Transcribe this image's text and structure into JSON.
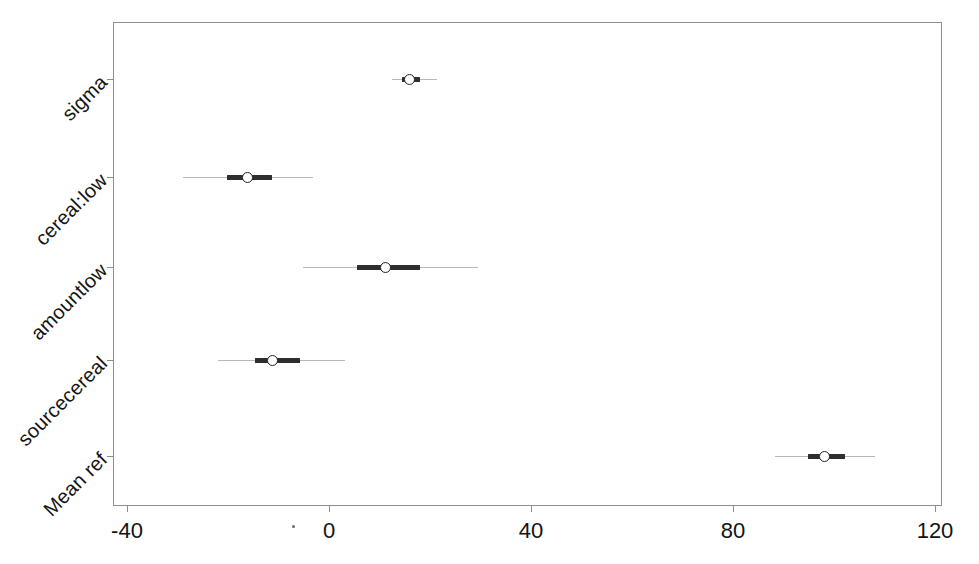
{
  "chart_data": {
    "type": "scatter",
    "title": "",
    "subtitle": "",
    "xlabel": "",
    "ylabel": "",
    "xlim": [
      -40,
      120
    ],
    "xticks": [
      -40,
      0,
      40,
      80,
      120
    ],
    "xticklabels": [
      "-40",
      "0",
      "40",
      "80",
      "120"
    ],
    "grid": false,
    "legend": null,
    "orientation": "horizontal",
    "categories": [
      "sigma",
      "cereal:low",
      "amountlow",
      "sourcecereal",
      "Mean ref"
    ],
    "series": [
      {
        "name": "point estimate",
        "values": [
          16.0,
          -16.2,
          11.1,
          -11.1,
          98.2
        ]
      },
      {
        "name": "inner interval (thick)",
        "lower": [
          14.5,
          -20.2,
          5.5,
          -14.7,
          94.9
        ],
        "upper": [
          18.0,
          -11.3,
          18.0,
          -5.7,
          102.2
        ]
      },
      {
        "name": "outer interval (thin)",
        "lower": [
          12.5,
          -28.9,
          -5.1,
          -22.0,
          88.3
        ],
        "upper": [
          21.4,
          -3.2,
          29.5,
          3.2,
          108.1
        ]
      }
    ],
    "rows": [
      {
        "label": "sigma",
        "estimate": 16.0,
        "inner_low": 14.5,
        "inner_high": 18.0,
        "outer_low": 12.5,
        "outer_high": 21.4
      },
      {
        "label": "cereal:low",
        "estimate": -16.2,
        "inner_low": -20.2,
        "inner_high": -11.3,
        "outer_low": -28.9,
        "outer_high": -3.2
      },
      {
        "label": "amountlow",
        "estimate": 11.1,
        "inner_low": 5.5,
        "inner_high": 18.0,
        "outer_low": -5.1,
        "outer_high": 29.5
      },
      {
        "label": "sourcecereal",
        "estimate": -11.1,
        "inner_low": -14.7,
        "inner_high": -5.7,
        "outer_low": -22.0,
        "outer_high": 3.2
      },
      {
        "label": "Mean ref",
        "estimate": 98.2,
        "inner_low": 94.9,
        "inner_high": 102.2,
        "outer_low": 88.3,
        "outer_high": 108.1
      }
    ],
    "colors": {
      "point_edge": "#232323",
      "point_fill": "#ffffff",
      "inner_interval": "#2e2e2e",
      "outer_interval": "#b8b8b8",
      "frame": "#8e8e8e",
      "background": "#ffffff",
      "text": "#131313"
    }
  }
}
